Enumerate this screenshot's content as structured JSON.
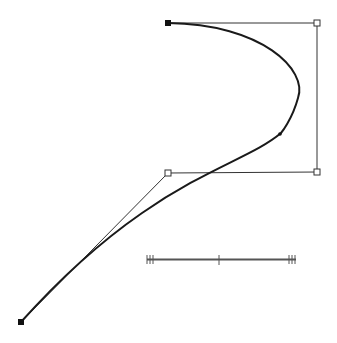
{
  "diagram": {
    "type": "bezier-curve-editor",
    "colors": {
      "curve": "#1a1a1a",
      "handle_line": "#333333",
      "anchor_fill": "#111111",
      "control_fill": "#ffffff",
      "scale_bar": "#555555"
    },
    "anchors": [
      {
        "name": "start-anchor",
        "x": 168,
        "y": 23
      },
      {
        "name": "end-anchor",
        "x": 21,
        "y": 322
      }
    ],
    "segment_1": {
      "start": [
        168,
        23
      ],
      "c1": [
        317,
        23
      ],
      "c2": [
        317,
        172
      ],
      "end": [
        281,
        133
      ]
    },
    "segment_2": {
      "start": [
        281,
        133
      ],
      "c1": [
        240,
        180
      ],
      "c2": [
        140,
        180
      ],
      "end": [
        21,
        322
      ]
    },
    "control_points": [
      {
        "name": "control-point-top-right",
        "x": 317,
        "y": 23
      },
      {
        "name": "control-point-bottom-right",
        "x": 317,
        "y": 172
      },
      {
        "name": "control-point-left",
        "x": 168,
        "y": 173
      }
    ],
    "scale_bar": {
      "x1": 147,
      "x2": 296,
      "y": 260,
      "mid_x": 219
    }
  }
}
